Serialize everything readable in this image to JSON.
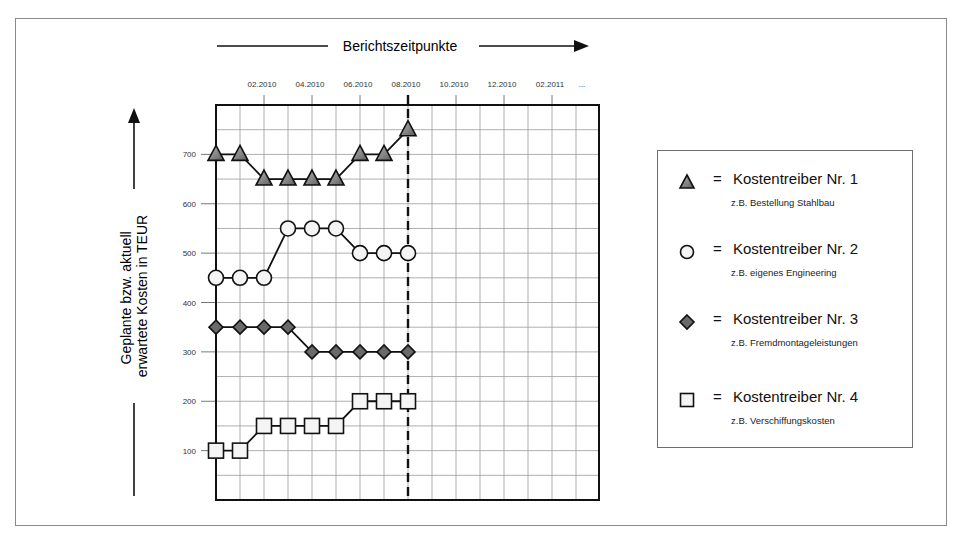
{
  "chart_data": {
    "type": "line",
    "title": "Berichtszeitpunkte",
    "xlabel": "Berichtszeitpunkte",
    "ylabel": "Geplante bzw. aktuell erwartete Kosten in TEUR",
    "ylabel_lines": [
      "Geplante bzw. aktuell",
      "erwartete Kosten in TEUR"
    ],
    "x_tick_labels": [
      "02.2010",
      "04.2010",
      "06.2010",
      "08.2010",
      "10.2010",
      "12.2010",
      "02.2011",
      "..."
    ],
    "y_tick_labels": [
      "100",
      "200",
      "300",
      "400",
      "500",
      "600",
      "700"
    ],
    "ylim": [
      0,
      800
    ],
    "grid": true,
    "current_report_marker": "08.2010",
    "x": [
      "01.2010",
      "02.2010",
      "03.2010",
      "04.2010",
      "05.2010",
      "06.2010",
      "07.2010",
      "08.2010",
      "09.2010"
    ],
    "series": [
      {
        "name": "Kostentreiber Nr. 1",
        "marker": "triangle",
        "example": "z.B. Bestellung Stahlbau",
        "values": [
          700,
          700,
          650,
          650,
          650,
          650,
          700,
          700,
          750
        ]
      },
      {
        "name": "Kostentreiber Nr. 2",
        "marker": "circle",
        "example": "z.B. eigenes Engineering",
        "values": [
          450,
          450,
          450,
          550,
          550,
          550,
          500,
          500,
          500
        ]
      },
      {
        "name": "Kostentreiber Nr. 3",
        "marker": "diamond",
        "example": "z.B. Fremdmontageleistungen",
        "values": [
          350,
          350,
          350,
          350,
          300,
          300,
          300,
          300,
          300
        ]
      },
      {
        "name": "Kostentreiber Nr. 4",
        "marker": "square",
        "example": "z.B. Verschiffungskosten",
        "values": [
          100,
          100,
          150,
          150,
          150,
          150,
          200,
          200,
          200
        ]
      }
    ],
    "legend_position": "right"
  },
  "legend": {
    "equals": "=",
    "items": [
      {
        "label": "Kostentreiber Nr. 1",
        "sub": "z.B. Bestellung Stahlbau"
      },
      {
        "label": "Kostentreiber Nr. 2",
        "sub": "z.B. eigenes Engineering"
      },
      {
        "label": "Kostentreiber Nr. 3",
        "sub": "z.B. Fremdmontageleistungen"
      },
      {
        "label": "Kostentreiber Nr. 4",
        "sub": "z.B. Verschiffungskosten"
      }
    ]
  },
  "colors": {
    "triangle_fill": "#8c8c8c",
    "diamond_fill": "#6a6a6a",
    "open_fill": "#f4f4f4",
    "grid": "#9a9a9a",
    "line": "#111111"
  }
}
